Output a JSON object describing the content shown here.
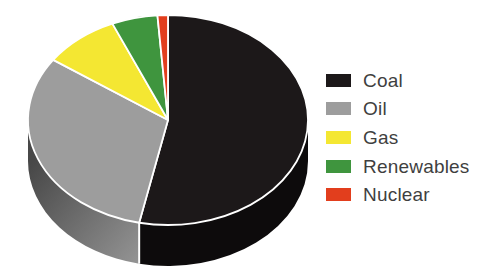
{
  "chart_data": {
    "type": "pie",
    "style": "3d",
    "title": "",
    "categories": [
      "Coal",
      "Oil",
      "Gas",
      "Renewables",
      "Nuclear"
    ],
    "values": [
      53.3,
      31.4,
      8.8,
      5.3,
      1.2
    ],
    "start_angle_deg": 0,
    "direction": "clockwise",
    "legend_position": "right",
    "colors": [
      "#1c1819",
      "#9d9d9d",
      "#f4e732",
      "#3f953e",
      "#e23e1d"
    ],
    "side_colors": [
      "#0d0b0c",
      "#6f6f6f",
      "#b4aa20",
      "#2c6e2c",
      "#a52c14"
    ],
    "side_gradient_oil": {
      "from": "#484848",
      "to": "#969696"
    },
    "separator_color": "#ffffff",
    "background": "#ffffff"
  },
  "legend": {
    "items": [
      {
        "label": "Coal"
      },
      {
        "label": "Oil"
      },
      {
        "label": "Gas"
      },
      {
        "label": "Renewables"
      },
      {
        "label": "Nuclear"
      }
    ]
  }
}
